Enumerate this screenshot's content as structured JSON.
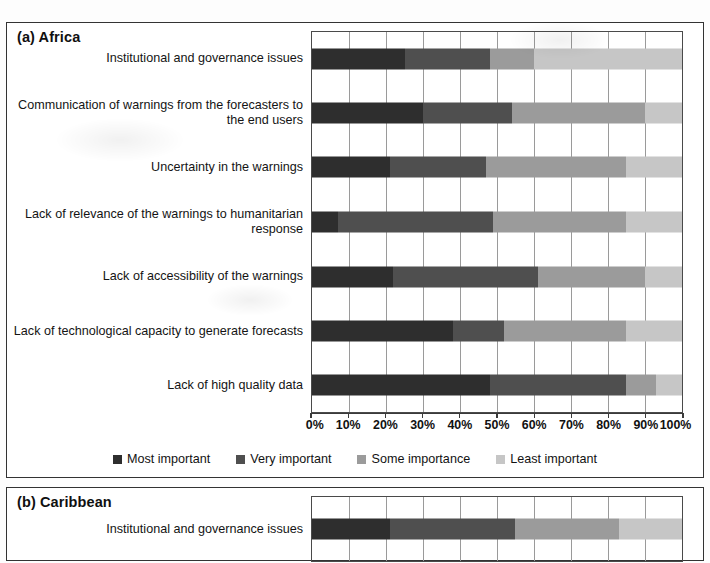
{
  "figure": {
    "panels": [
      {
        "id": "a",
        "title": "(a) Africa"
      },
      {
        "id": "b",
        "title": "(b) Caribbean"
      }
    ]
  },
  "legend": {
    "position": "bottom-center",
    "items": [
      {
        "label": "Most important",
        "color": "#2e2e2e"
      },
      {
        "label": "Very important",
        "color": "#4f4f4f"
      },
      {
        "label": "Some importance",
        "color": "#9b9b9b"
      },
      {
        "label": "Least importance_placeholder",
        "color": "#c6c6c6"
      }
    ],
    "labels": {
      "most": "Most important",
      "very": "Very important",
      "some": "Some importance",
      "least": "Least important"
    }
  },
  "axis": {
    "ticks": [
      "0%",
      "10%",
      "20%",
      "30%",
      "40%",
      "50%",
      "60%",
      "70%",
      "80%",
      "90%",
      "100%"
    ],
    "min": 0,
    "max": 100,
    "unit": "%"
  },
  "chart_data": [
    {
      "type": "bar",
      "orientation": "horizontal",
      "stacked": true,
      "normalized": true,
      "title": "(a) Africa",
      "xlabel": "",
      "ylabel": "",
      "xlim": [
        0,
        100
      ],
      "grid": true,
      "legend_position": "bottom",
      "categories": [
        "Institutional and governance issues",
        "Communication of warnings from the forecasters to the end users",
        "Uncertainty in the warnings",
        "Lack of relevance of the warnings to humanitarian response",
        "Lack of accessibility of the warnings",
        "Lack of technological capacity to generate forecasts",
        "Lack of high quality data"
      ],
      "series": [
        {
          "name": "Most important",
          "color": "#2e2e2e",
          "values": [
            25,
            30,
            21,
            7,
            22,
            38,
            48
          ]
        },
        {
          "name": "Very important",
          "color": "#4f4f4f",
          "values": [
            23,
            24,
            26,
            42,
            39,
            14,
            37
          ]
        },
        {
          "name": "Some importance",
          "color": "#9b9b9b",
          "values": [
            12,
            36,
            38,
            36,
            29,
            33,
            8
          ]
        },
        {
          "name": "Least important",
          "color": "#c6c6c6",
          "values": [
            40,
            10,
            15,
            15,
            10,
            15,
            7
          ]
        }
      ]
    },
    {
      "type": "bar",
      "orientation": "horizontal",
      "stacked": true,
      "normalized": true,
      "title": "(b) Caribbean",
      "xlabel": "",
      "ylabel": "",
      "xlim": [
        0,
        100
      ],
      "grid": true,
      "legend_position": "none",
      "categories": [
        "Institutional and governance issues"
      ],
      "series": [
        {
          "name": "Most important",
          "color": "#2e2e2e",
          "values": [
            21
          ]
        },
        {
          "name": "Very important",
          "color": "#4f4f4f",
          "values": [
            34
          ]
        },
        {
          "name": "Some importance",
          "color": "#9b9b9b",
          "values": [
            28
          ]
        },
        {
          "name": "Least important",
          "color": "#c6c6c6",
          "values": [
            17
          ]
        }
      ]
    }
  ]
}
